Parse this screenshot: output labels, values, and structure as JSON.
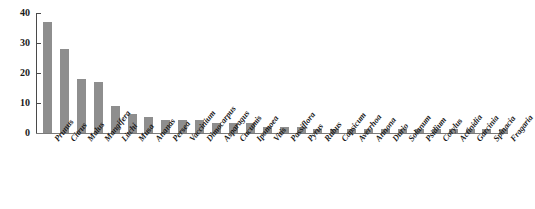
{
  "chart_data": {
    "type": "bar",
    "title": "",
    "subtitle": "",
    "xlabel": "",
    "ylabel": "",
    "ylim": [
      0,
      40
    ],
    "yticks": [
      0,
      10,
      20,
      30,
      40
    ],
    "grid": false,
    "legend": null,
    "bar_color": "#8e8e8e",
    "axis_color": "#4a4a4a",
    "categories": [
      "Prunus",
      "Citrus",
      "Malus",
      "Mangifera",
      "Litchi",
      "Musa",
      "Ananas",
      "Persea",
      "Vaccinium",
      "Dimocarpus",
      "Asparagus",
      "Cucumis",
      "Ipomoea",
      "Vitis",
      "Passiflora",
      "Pyrus",
      "Rubus",
      "Capsicum",
      "Averrhoa",
      "Annona",
      "Durio",
      "Solanum",
      "Psidium",
      "Corylus",
      "Actinidia",
      "Garcinia",
      "Spinacia",
      "Fragaria"
    ],
    "values": [
      37,
      28,
      18,
      17,
      9,
      6.3,
      5.2,
      4.4,
      4.3,
      4.3,
      3.4,
      3.4,
      3.3,
      2,
      2,
      2,
      1.3,
      1.2,
      1.3,
      1.4,
      1.4,
      1.4,
      1.4,
      1.5,
      1.5,
      1.4,
      1.4,
      1.5
    ]
  }
}
